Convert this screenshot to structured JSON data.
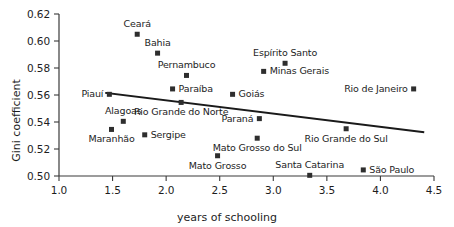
{
  "chart_data": {
    "type": "scatter",
    "title": "",
    "xlabel": "years of schooling",
    "ylabel": "Gini coefficient",
    "xlim": [
      1.0,
      4.5
    ],
    "ylim": [
      0.5,
      0.62
    ],
    "xticks": [
      "1.0",
      "1.5",
      "2.0",
      "2.5",
      "3.0",
      "3.5",
      "4.0",
      "4.5"
    ],
    "yticks": [
      "0.50",
      "0.52",
      "0.54",
      "0.56",
      "0.58",
      "0.60",
      "0.62"
    ],
    "grid": false,
    "legend": "none",
    "marker_color": "#2e2e2e",
    "line_color": "#1a1a1a",
    "axis_color": "#3a3a3a",
    "points": [
      {
        "label": "Ceará",
        "x": 1.73,
        "y": 0.605,
        "label_pos": "above"
      },
      {
        "label": "Bahia",
        "x": 1.92,
        "y": 0.591,
        "label_pos": "above"
      },
      {
        "label": "Pernambuco",
        "x": 2.19,
        "y": 0.5745,
        "label_pos": "above"
      },
      {
        "label": "Paraíba",
        "x": 2.06,
        "y": 0.5645,
        "label_pos": "right"
      },
      {
        "label": "Piauí",
        "x": 1.47,
        "y": 0.5605,
        "label_pos": "left"
      },
      {
        "label": "Rio Grande do Norte",
        "x": 2.14,
        "y": 0.5545,
        "label_pos": "below"
      },
      {
        "label": "Alagoas",
        "x": 1.6,
        "y": 0.5405,
        "label_pos": "above"
      },
      {
        "label": "Maranhão",
        "x": 1.49,
        "y": 0.5345,
        "label_pos": "below"
      },
      {
        "label": "Sergipe",
        "x": 1.8,
        "y": 0.5305,
        "label_pos": "right"
      },
      {
        "label": "Espírito Santo",
        "x": 3.11,
        "y": 0.5835,
        "label_pos": "above"
      },
      {
        "label": "Minas Gerais",
        "x": 2.91,
        "y": 0.5775,
        "label_pos": "right"
      },
      {
        "label": "Goiás",
        "x": 2.62,
        "y": 0.5605,
        "label_pos": "right"
      },
      {
        "label": "Rio de Janeiro",
        "x": 4.31,
        "y": 0.5645,
        "label_pos": "left"
      },
      {
        "label": "Paraná",
        "x": 2.87,
        "y": 0.5425,
        "label_pos": "left"
      },
      {
        "label": "Rio Grande do Sul",
        "x": 3.68,
        "y": 0.535,
        "label_pos": "below"
      },
      {
        "label": "Mato Grosso do Sul",
        "x": 2.85,
        "y": 0.528,
        "label_pos": "below"
      },
      {
        "label": "Mato Grosso",
        "x": 2.48,
        "y": 0.515,
        "label_pos": "below"
      },
      {
        "label": "São Paulo",
        "x": 3.84,
        "y": 0.5045,
        "label_pos": "right"
      },
      {
        "label": "Santa Catarina",
        "x": 3.34,
        "y": 0.5005,
        "label_pos": "above"
      }
    ],
    "trend_line": {
      "x_start": 1.44,
      "y_start": 0.5615,
      "x_end": 4.4,
      "y_end": 0.5325
    }
  }
}
